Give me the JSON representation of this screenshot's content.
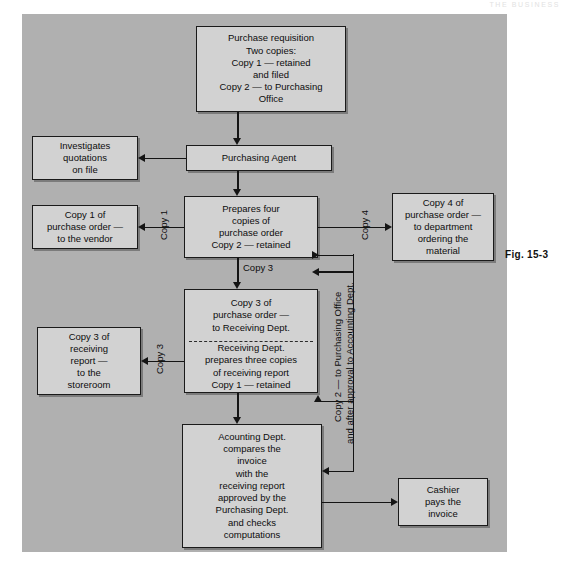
{
  "figure": {
    "caption": "Fig.  15-3",
    "header_faint": "THE BUSINESS"
  },
  "boxes": {
    "purchase_requisition": {
      "lines": [
        "Purchase requisition",
        "Two copies:",
        "Copy 1 — retained",
        "and filed",
        "Copy 2 — to Purchasing",
        "Office"
      ]
    },
    "purchasing_agent": {
      "lines": [
        "Purchasing Agent"
      ]
    },
    "investigates_quotations": {
      "lines": [
        "Investigates",
        "quotations",
        "on file"
      ]
    },
    "prepares_four_copies": {
      "lines": [
        "Prepares  four",
        "copies of",
        "purchase order",
        "Copy 2 — retained"
      ]
    },
    "copy1_vendor": {
      "lines": [
        "Copy 1 of",
        "purchase order —",
        "to the vendor"
      ]
    },
    "copy4_department": {
      "lines": [
        "Copy 4 of",
        "purchase order —",
        "to department",
        "ordering the",
        "material"
      ]
    },
    "copy3_receiving": {
      "lines": [
        "Copy 3 of",
        "purchase order —",
        "to Receiving Dept."
      ]
    },
    "receiving_dept": {
      "lines": [
        "Receiving Dept.",
        "prepares three copies",
        "of receiving report",
        "Copy 1 — retained"
      ]
    },
    "copy3_storeroom": {
      "lines": [
        "Copy 3 of",
        "receiving",
        "report —",
        "to the",
        "storeroom"
      ]
    },
    "accounting_dept": {
      "lines": [
        "Acounting Dept.",
        "compares the",
        "invoice",
        "with the",
        "receiving report",
        "approved by the",
        "Purchasing Dept.",
        "and checks",
        "computations"
      ]
    },
    "cashier": {
      "lines": [
        "Cashier",
        "pays the",
        "invoice"
      ]
    }
  },
  "edge_labels": {
    "copy1": "Copy 1",
    "copy4": "Copy 4",
    "copy3_down": "Copy 3",
    "copy3_left": "Copy 3",
    "copy2_line1": "Copy 2 — to Purchasing Office",
    "copy2_line2": "and after approval to Accounting Dept."
  },
  "colors": {
    "field": "#b0b0b0",
    "box_fill": "#d2d2d2",
    "stroke": "#1a1a1a",
    "page": "#ffffff"
  }
}
